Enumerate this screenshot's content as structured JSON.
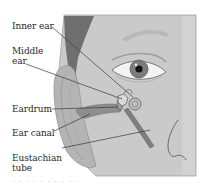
{
  "diagram": {
    "labels": [
      {
        "id": "inner-ear",
        "text": "Inner ear",
        "line2": ""
      },
      {
        "id": "middle-ear",
        "text": "Middle",
        "line2": "ear"
      },
      {
        "id": "eardrum",
        "text": "Eardrum",
        "line2": ""
      },
      {
        "id": "ear-canal",
        "text": "Ear canal",
        "line2": ""
      },
      {
        "id": "eustachian-tube",
        "text": "Eustachian",
        "line2": "tube"
      }
    ],
    "caption_fragment": "· · · ·  ·  ·  · · · ·"
  },
  "colors": {
    "panel": "#c9c9c9",
    "panel_border": "#9d9d9d",
    "hair": "#6e6e6e",
    "ear_skin": "#b3b3b3",
    "leader_line": "#3a3a3a",
    "tube": "#7d7d7d",
    "label_text": "#2a2a2a"
  }
}
